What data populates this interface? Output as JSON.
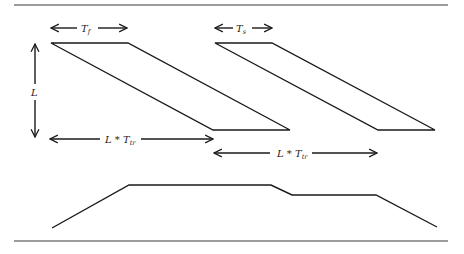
{
  "figure": {
    "type": "timing-diagram",
    "labels": {
      "tf": {
        "main": "T",
        "sub": "f"
      },
      "ts": {
        "main": "T",
        "sub": "s"
      },
      "L": "L",
      "ltr_1": {
        "main": "L * T",
        "sub": "tr"
      },
      "ltr_2": {
        "main": "L * T",
        "sub": "tr"
      }
    },
    "shapes": {
      "parallelogram_1": {
        "top": [
          [
            51,
            43
          ],
          [
            128,
            43
          ]
        ],
        "bottom": [
          [
            213,
            130
          ],
          [
            290,
            130
          ]
        ]
      },
      "parallelogram_2": {
        "top": [
          [
            215,
            43
          ],
          [
            272,
            43
          ]
        ],
        "bottom": [
          [
            378,
            130
          ],
          [
            435,
            130
          ]
        ]
      },
      "profile": [
        [
          52,
          228
        ],
        [
          129,
          185
        ],
        [
          271,
          185
        ],
        [
          292,
          195
        ],
        [
          376,
          195
        ],
        [
          437,
          227
        ]
      ]
    },
    "colors": {
      "line": "#1a1a1a",
      "rule": "#3a3a3a",
      "background": "#ffffff"
    }
  }
}
